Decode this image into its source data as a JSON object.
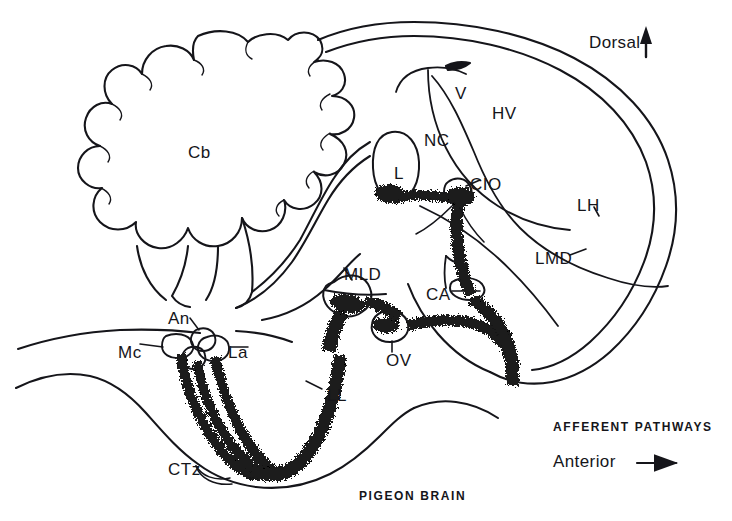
{
  "figure": {
    "type": "anatomical-diagram",
    "subject": "PIGEON BRAIN",
    "caption_main": "PIGEON BRAIN",
    "caption_pathways": "AFFERENT  PATHWAYS",
    "orientation_dorsal": "Dorsal",
    "orientation_anterior": "Anterior",
    "line_color": "#15151a",
    "background_color": "#ffffff",
    "stipple_color": "#1a1a1a"
  },
  "labels": [
    {
      "id": "cb",
      "text": "Cb",
      "x": 188,
      "y": 143,
      "desc": "cerebellum"
    },
    {
      "id": "v",
      "text": "V",
      "x": 455,
      "y": 84,
      "desc": "ventricle"
    },
    {
      "id": "hv",
      "text": "HV",
      "x": 492,
      "y": 104,
      "desc": "hyperstriatum-ventrale"
    },
    {
      "id": "nc",
      "text": "NC",
      "x": 424,
      "y": 131,
      "desc": "neostriatum-caudale"
    },
    {
      "id": "l",
      "text": "L",
      "x": 394,
      "y": 164,
      "desc": "field-L"
    },
    {
      "id": "cio",
      "text": "CIO",
      "x": 470,
      "y": 175,
      "desc": "capsula-interna-occipitalis"
    },
    {
      "id": "lh",
      "text": "LH",
      "x": 577,
      "y": 196,
      "desc": "lamina-hyperstriatica"
    },
    {
      "id": "lmd",
      "text": "LMD",
      "x": 535,
      "y": 249,
      "desc": "lamina-medullaris-dorsalis"
    },
    {
      "id": "ca",
      "text": "CA",
      "x": 426,
      "y": 285,
      "desc": "commissura-anterior"
    },
    {
      "id": "mld",
      "text": "MLD",
      "x": 344,
      "y": 265,
      "desc": "nucleus-mesencephalicus-lateralis-dorsalis"
    },
    {
      "id": "ov",
      "text": "OV",
      "x": 386,
      "y": 351,
      "desc": "nucleus-ovoidalis"
    },
    {
      "id": "an",
      "text": "An",
      "x": 168,
      "y": 309,
      "desc": "nucleus-angularis"
    },
    {
      "id": "mc",
      "text": "Mc",
      "x": 118,
      "y": 343,
      "desc": "nucleus-magnocellularis"
    },
    {
      "id": "la",
      "text": "La",
      "x": 228,
      "y": 343,
      "desc": "nucleus-laminaris"
    },
    {
      "id": "ll",
      "text": "LL",
      "x": 327,
      "y": 386,
      "desc": "lemniscus-lateralis"
    },
    {
      "id": "ctz",
      "text": "CTz",
      "x": 168,
      "y": 460,
      "desc": "corpus-trapezoideum"
    }
  ],
  "captions": [
    {
      "id": "afferent-pathways",
      "text": "AFFERENT  PATHWAYS",
      "x": 553,
      "y": 420
    },
    {
      "id": "pigeon-brain",
      "text": "PIGEON BRAIN",
      "x": 359,
      "y": 489
    }
  ],
  "directions": [
    {
      "id": "dorsal",
      "text": "Dorsal",
      "x": 589,
      "y": 33,
      "arrow": "up-arrow-icon"
    },
    {
      "id": "anterior",
      "text": "Anterior",
      "x": 553,
      "y": 455,
      "arrow": "right-arrow-icon"
    }
  ]
}
